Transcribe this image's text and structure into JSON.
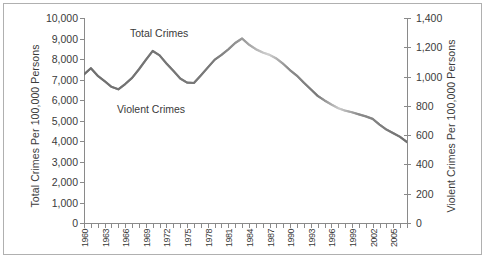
{
  "chart_data": {
    "type": "line",
    "title": "",
    "xlabel": "",
    "ylabel": "Total Crimes Per 100,000 Persons",
    "y2label": "Violent Crimes Per 100,000 Persons",
    "grid": false,
    "legend_position": "inline-annotation",
    "ylim": [
      0,
      10000
    ],
    "y2lim": [
      0,
      1400
    ],
    "ytick_labels": [
      "10,000",
      "9,000",
      "8,000",
      "7,000",
      "6,000",
      "5,000",
      "4,000",
      "3,000",
      "2,000",
      "1,000",
      "0"
    ],
    "ytick_values": [
      10000,
      9000,
      8000,
      7000,
      6000,
      5000,
      4000,
      3000,
      2000,
      1000,
      0
    ],
    "y2tick_labels": [
      "1,400",
      "1,200",
      "1,000",
      "800",
      "600",
      "400",
      "200",
      "0"
    ],
    "y2tick_values": [
      1400,
      1200,
      1000,
      800,
      600,
      400,
      200,
      0
    ],
    "x": [
      1960,
      1961,
      1962,
      1963,
      1964,
      1965,
      1966,
      1967,
      1968,
      1969,
      1970,
      1971,
      1972,
      1973,
      1974,
      1975,
      1976,
      1977,
      1978,
      1979,
      1980,
      1981,
      1982,
      1983,
      1984,
      1985,
      1986,
      1987,
      1988,
      1989,
      1990,
      1991,
      1992,
      1993,
      1994,
      1995,
      1996,
      1997,
      1998,
      1999,
      2000,
      2001,
      2002,
      2003,
      2004,
      2005,
      2006,
      2007
    ],
    "xtick_labels": [
      "1",
      "1",
      "1",
      "1",
      "1",
      "1",
      "1",
      "1",
      "1",
      "1",
      "2",
      "2",
      "2",
      "2",
      "2",
      "2"
    ],
    "xtick_note": "year labels clipped by plot area; 1900s show as 1, 2000s show as 2",
    "series": [
      {
        "name": "Total Crimes",
        "axis": "left",
        "color": "#808080",
        "values": [
          7250,
          7550,
          7180,
          6920,
          6640,
          6520,
          6780,
          7080,
          7500,
          7960,
          8390,
          8180,
          7780,
          7420,
          7050,
          6850,
          6830,
          7200,
          7580,
          7960,
          8200,
          8470,
          8780,
          9000,
          8700,
          8480,
          8320,
          8200,
          8020,
          7760,
          7450,
          7180,
          6840,
          6520,
          6200,
          5980,
          5780,
          5600,
          5480,
          5400,
          5300,
          5200,
          5080,
          4800,
          4560,
          4380,
          4200,
          3950
        ]
      },
      {
        "name": "Violent Crimes",
        "axis": "right",
        "color": "#808080",
        "values": [
          1015,
          1057,
          1005,
          969,
          930,
          913,
          949,
          991,
          1050,
          1114,
          1175,
          1145,
          1089,
          1039,
          987,
          959,
          956,
          1008,
          1061,
          1114,
          1148,
          1186,
          1229,
          1260,
          1218,
          1187,
          1165,
          1148,
          1123,
          1086,
          1043,
          1005,
          958,
          913,
          868,
          837,
          809,
          784,
          767,
          756,
          742,
          728,
          711,
          672,
          638,
          613,
          588,
          553
        ]
      }
    ]
  },
  "axes": {
    "left_title": "Total Crimes Per 100,000 Persons",
    "right_title": "Violent Crimes Per 100,000 Persons"
  },
  "annotations": {
    "total_crimes": "Total Crimes",
    "violent_crimes": "Violent Crimes"
  },
  "caption": ""
}
